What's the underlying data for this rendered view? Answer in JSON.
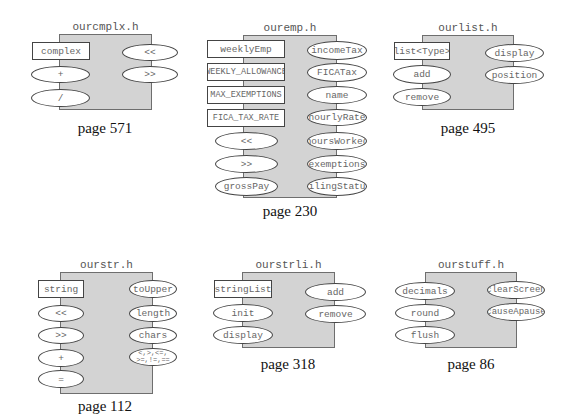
{
  "diagrams": [
    {
      "title": "ourcmplx.h",
      "page": "page 571",
      "items": [
        {
          "label": "complex",
          "shape": "rect"
        },
        {
          "label": "+",
          "shape": "ellipse"
        },
        {
          "label": "/",
          "shape": "ellipse"
        },
        {
          "label": "<<",
          "shape": "ellipse"
        },
        {
          "label": ">>",
          "shape": "ellipse"
        }
      ]
    },
    {
      "title": "ouremp.h",
      "page": "page 230",
      "items": [
        {
          "label": "weeklyEmp",
          "shape": "rect"
        },
        {
          "label": "WEEKLY_ALLOWANCE",
          "shape": "rect"
        },
        {
          "label": "MAX_EXEMPTIONS",
          "shape": "rect"
        },
        {
          "label": "FICA_TAX_RATE",
          "shape": "rect"
        },
        {
          "label": "<<",
          "shape": "ellipse"
        },
        {
          "label": ">>",
          "shape": "ellipse"
        },
        {
          "label": "grossPay",
          "shape": "ellipse"
        },
        {
          "label": "incomeTax",
          "shape": "ellipse"
        },
        {
          "label": "FICATax",
          "shape": "ellipse"
        },
        {
          "label": "name",
          "shape": "ellipse"
        },
        {
          "label": "hourlyRate",
          "shape": "ellipse"
        },
        {
          "label": "hoursWorked",
          "shape": "ellipse"
        },
        {
          "label": "exemptions",
          "shape": "ellipse"
        },
        {
          "label": "filingStatus",
          "shape": "ellipse"
        }
      ]
    },
    {
      "title": "ourlist.h",
      "page": "page 495",
      "items": [
        {
          "label": "list<Type>",
          "shape": "rect"
        },
        {
          "label": "add",
          "shape": "ellipse"
        },
        {
          "label": "remove",
          "shape": "ellipse"
        },
        {
          "label": "display",
          "shape": "ellipse"
        },
        {
          "label": "position",
          "shape": "ellipse"
        }
      ]
    },
    {
      "title": "ourstr.h",
      "page": "page 112",
      "items": [
        {
          "label": "string",
          "shape": "rect"
        },
        {
          "label": "<<",
          "shape": "ellipse"
        },
        {
          "label": ">>",
          "shape": "ellipse"
        },
        {
          "label": "+",
          "shape": "ellipse"
        },
        {
          "label": "=",
          "shape": "ellipse"
        },
        {
          "label": "toUpper",
          "shape": "ellipse"
        },
        {
          "label": "length",
          "shape": "ellipse"
        },
        {
          "label": "chars",
          "shape": "ellipse"
        },
        {
          "label": "<,>,<=,\n>=,!=,==",
          "shape": "ellipse"
        }
      ]
    },
    {
      "title": "ourstrli.h",
      "page": "page 318",
      "items": [
        {
          "label": "stringList",
          "shape": "rect"
        },
        {
          "label": "init",
          "shape": "ellipse"
        },
        {
          "label": "display",
          "shape": "ellipse"
        },
        {
          "label": "add",
          "shape": "ellipse"
        },
        {
          "label": "remove",
          "shape": "ellipse"
        }
      ]
    },
    {
      "title": "ourstuff.h",
      "page": "page 86",
      "items": [
        {
          "label": "decimals",
          "shape": "ellipse"
        },
        {
          "label": "round",
          "shape": "ellipse"
        },
        {
          "label": "flush",
          "shape": "ellipse"
        },
        {
          "label": "clearScreen",
          "shape": "ellipse"
        },
        {
          "label": "causeApause",
          "shape": "ellipse"
        }
      ]
    }
  ]
}
